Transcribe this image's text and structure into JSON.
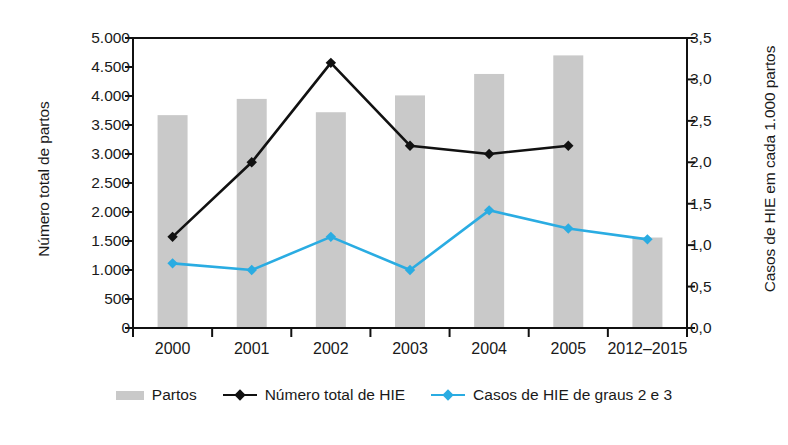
{
  "chart_data": {
    "type": "bar",
    "title": "",
    "subtitle": "",
    "categories": [
      "2000",
      "2001",
      "2002",
      "2003",
      "2004",
      "2005",
      "2012–2015"
    ],
    "xlabel": "",
    "ylabel": "Número total de partos",
    "y2label": "Casos de HIE em cada 1.000 partos",
    "ylim": [
      0,
      5000
    ],
    "y2lim": [
      0,
      3.5
    ],
    "yticks": [
      "0",
      "500",
      "1.000",
      "1.500",
      "2.000",
      "2.500",
      "3.000",
      "3.500",
      "4.000",
      "4.500",
      "5.000"
    ],
    "ytick_values": [
      0,
      500,
      1000,
      1500,
      2000,
      2500,
      3000,
      3500,
      4000,
      4500,
      5000
    ],
    "y2ticks": [
      "0,0",
      "0,5",
      "1,0",
      "1,5",
      "2,0",
      "2,5",
      "3,0",
      "3,5"
    ],
    "y2tick_values": [
      0,
      0.5,
      1.0,
      1.5,
      2.0,
      2.5,
      3.0,
      3.5
    ],
    "grid": false,
    "legend_position": "bottom",
    "series": [
      {
        "name": "Partos",
        "type": "bar",
        "axis": "left",
        "color": "#c9c9c9",
        "values": [
          3670,
          3950,
          3720,
          4010,
          4380,
          4700,
          1560
        ]
      },
      {
        "name": "Número total de HIE",
        "type": "line",
        "axis": "right",
        "color": "#111111",
        "marker": "diamond",
        "values": [
          1.1,
          2.0,
          3.2,
          2.2,
          2.1,
          2.2,
          null
        ]
      },
      {
        "name": "Casos de HIE de graus 2 e 3",
        "type": "line",
        "axis": "right",
        "color": "#2aace2",
        "marker": "diamond",
        "values": [
          0.78,
          0.7,
          1.1,
          0.7,
          1.42,
          1.2,
          1.07
        ]
      }
    ]
  },
  "legend": {
    "items": [
      {
        "label": "Partos",
        "swatch": "bar",
        "color": "#c9c9c9"
      },
      {
        "label": "Número total de HIE",
        "swatch": "line-diamond",
        "color": "#111111"
      },
      {
        "label": "Casos de HIE de graus 2 e 3",
        "swatch": "line-diamond",
        "color": "#2aace2"
      }
    ]
  }
}
